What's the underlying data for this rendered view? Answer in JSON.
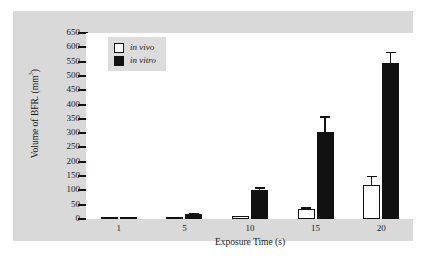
{
  "chart_data": {
    "type": "bar",
    "title": "",
    "xlabel": "Exposure Time  (s)",
    "ylabel_text": "Volume of BFR.  (mm",
    "ylabel_sup": "3",
    "ylabel_close": ")",
    "categories": [
      "1",
      "5",
      "10",
      "15",
      "20"
    ],
    "ylim": [
      0,
      650
    ],
    "yticks": [
      0,
      50,
      100,
      150,
      200,
      250,
      300,
      350,
      400,
      450,
      500,
      550,
      600,
      650
    ],
    "ytick_labels": [
      "0",
      "50",
      "100",
      "150",
      "200",
      "250",
      "300",
      "350",
      "400",
      "450",
      "500",
      "550",
      "600",
      "650"
    ],
    "grid": false,
    "legend_position": "top-left",
    "series": [
      {
        "name": "in vivo",
        "style": "open-square",
        "color": "#ffffff",
        "edge_color": "#111111",
        "values": [
          2,
          3,
          10,
          35,
          120
        ],
        "errors": [
          0,
          0,
          2,
          6,
          32
        ]
      },
      {
        "name": "in vitro",
        "style": "filled-square",
        "color": "#111111",
        "edge_color": "#111111",
        "values": [
          5,
          18,
          100,
          305,
          545
        ],
        "errors": [
          1,
          2,
          12,
          55,
          40
        ]
      }
    ]
  },
  "legend": {
    "items": [
      {
        "label": "in vivo",
        "swatch": "open-square"
      },
      {
        "label": "in vitro",
        "swatch": "filled-square"
      }
    ]
  },
  "colors": {
    "panel_background": "#d9d9d9",
    "plot_background": "#ffffff",
    "axis": "#111111",
    "legend_background": "#dcdcdc",
    "in_vivo": "#ffffff",
    "in_vitro": "#111111"
  }
}
